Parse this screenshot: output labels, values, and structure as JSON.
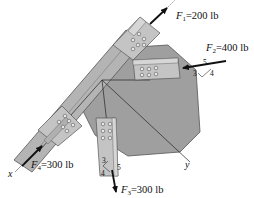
{
  "diagram": {
    "forces": [
      {
        "id": "F1",
        "symbol": "F",
        "subscript": "1",
        "value": "=200 lb"
      },
      {
        "id": "F2",
        "symbol": "F",
        "subscript": "2",
        "value": "=400 lb",
        "slope": {
          "hyp": "5",
          "a": "3",
          "b": "4"
        }
      },
      {
        "id": "F3",
        "symbol": "F",
        "subscript": "3",
        "value": "=300 lb",
        "slope": {
          "hyp": "5",
          "a": "3",
          "b": "4"
        }
      },
      {
        "id": "F4",
        "symbol": "F",
        "subscript": "4",
        "value": "=300 lb"
      }
    ],
    "axes": {
      "x": "x",
      "y": "y"
    },
    "colors": {
      "plate": "#a9a9a9",
      "plate_edge": "#555555",
      "member": "#bdbdbd",
      "member_dark": "#8e8e8e",
      "bolt": "#e8e8e8",
      "arrow": "#111111"
    }
  }
}
